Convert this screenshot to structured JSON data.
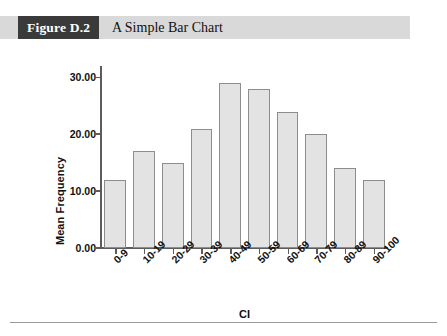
{
  "figure": {
    "number_label": "Figure D.2",
    "caption": "A Simple Bar Chart"
  },
  "colors": {
    "header_band": "#d9d9d9",
    "number_box": "#3a3a3a",
    "bar_fill": "#e3e3e3",
    "bar_border": "#8d8d8d",
    "axis": "#5c5c5c",
    "text": "#111111"
  },
  "chart_data": {
    "type": "bar",
    "title": "A Simple Bar Chart",
    "xlabel": "CI",
    "ylabel": "Mean Frequency",
    "categories": [
      "0-9",
      "10-19",
      "20-29",
      "30-39",
      "40-49",
      "50-59",
      "60-69",
      "70-79",
      "80-89",
      "90-100"
    ],
    "values": [
      12,
      17,
      15,
      21,
      29,
      28,
      24,
      20,
      14,
      12
    ],
    "ylim": [
      0,
      32
    ],
    "yticks": [
      0,
      10,
      20,
      30
    ],
    "ytick_labels": [
      "0.00",
      "10.00",
      "20.00",
      "30.00"
    ],
    "grid": false,
    "legend": null
  }
}
